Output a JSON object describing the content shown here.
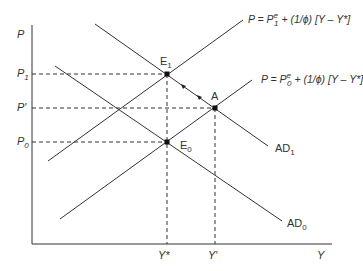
{
  "diagram": {
    "type": "AD-AS price adjustment",
    "axes": {
      "y_label": "P",
      "x_label": "Y"
    },
    "price_levels": [
      {
        "id": "P1",
        "label": "P",
        "sub": "1"
      },
      {
        "id": "Pprime",
        "label": "P′",
        "sub": ""
      },
      {
        "id": "P0",
        "label": "P",
        "sub": "0"
      }
    ],
    "output_levels": [
      {
        "id": "Ystar",
        "label": "Y*"
      },
      {
        "id": "Yprime",
        "label": "Y′"
      }
    ],
    "points": [
      {
        "id": "E1",
        "label": "E",
        "sub": "1"
      },
      {
        "id": "A",
        "label": "A",
        "sub": ""
      },
      {
        "id": "E0",
        "label": "E",
        "sub": "0"
      }
    ],
    "curves": {
      "as1": {
        "prefix": "P = P",
        "sub": "1",
        "sup": "e",
        "rest": " + (1/ϕ) [Y – Y*]"
      },
      "as0": {
        "prefix": "P = P",
        "sub": "0",
        "sup": "e",
        "rest": " + (1/ϕ) [Y – Y*]"
      },
      "ad1": {
        "label": "AD",
        "sub": "1"
      },
      "ad0": {
        "label": "AD",
        "sub": "0"
      }
    },
    "line_color": "#333333"
  }
}
